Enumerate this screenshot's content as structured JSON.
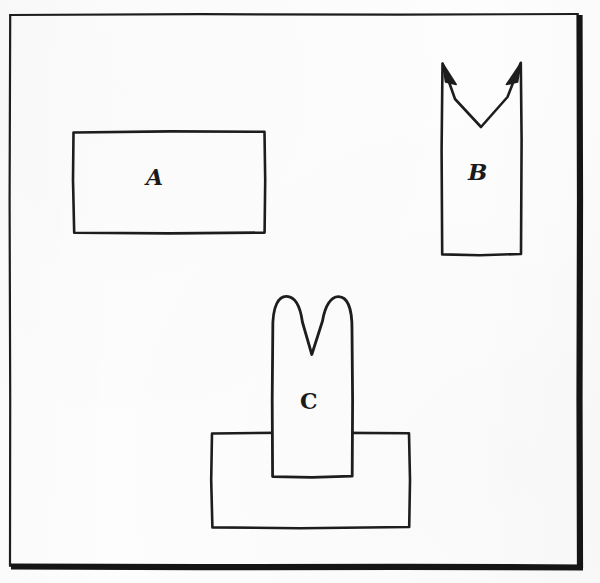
{
  "figure": {
    "kind": "hand-drawn-diagram",
    "medium": "scanned ink line drawing on white paper",
    "background_color": "#fdfdfd",
    "ink_color": "#1a1a1a",
    "frame": {
      "name": "page-border",
      "style": "rectangular border with heavy right and bottom edges (drop shadow effect)",
      "left": 9,
      "top": 14,
      "right": 585,
      "bottom": 570,
      "thin_stroke_px": 2,
      "heavy_stroke_px": 6
    },
    "shapes": [
      {
        "id": "A",
        "label": "A",
        "description": "plain horizontal rectangle",
        "x": 73,
        "y": 131,
        "width": 192,
        "height": 102,
        "notched": false
      },
      {
        "id": "B",
        "label": "B",
        "description": "tall vertical rectangle with a sharp V-notch cut into the top edge, with thin pointed spikes at the notch corners",
        "x": 441,
        "y": 62,
        "width": 81,
        "height": 193,
        "notched": true,
        "notch_shape": "sharp V",
        "notch_depth": 42
      },
      {
        "id": "C",
        "label": "C",
        "description": "tall vertical rectangle with a rounded V-notch on top, overlapping and drawn in front of a wide horizontal rectangle",
        "x": 272,
        "y": 296,
        "width": 80,
        "height": 181,
        "notched": true,
        "notch_shape": "rounded V",
        "notch_depth": 58,
        "overlaps": "base-rectangle"
      },
      {
        "id": "base",
        "label": "",
        "description": "wide horizontal rectangle beneath shape C",
        "x": 211,
        "y": 432,
        "width": 199,
        "height": 96,
        "notched": false
      }
    ],
    "labels": {
      "a": "A",
      "b": "B",
      "c": "C"
    }
  }
}
